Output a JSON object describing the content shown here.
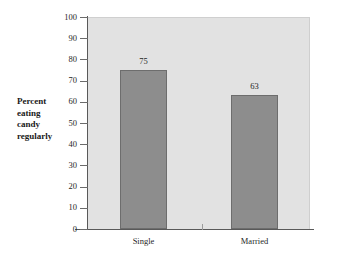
{
  "chart_data": {
    "type": "bar",
    "title": "",
    "subtitle": "",
    "xlabel": "",
    "ylabel": "Percent eating candy regularly",
    "ylabel_lines": [
      "Percent",
      "eating",
      "candy",
      "regularly"
    ],
    "categories": [
      "Single",
      "Married"
    ],
    "values": [
      75,
      63
    ],
    "data_labels": [
      "75",
      "63"
    ],
    "ylim": [
      0,
      100
    ],
    "ytick_step": 10,
    "yticks": [
      0,
      10,
      20,
      30,
      40,
      50,
      60,
      70,
      80,
      90,
      100
    ],
    "ytick_labels": [
      "0",
      "10",
      "20",
      "30",
      "40",
      "50",
      "60",
      "70",
      "80",
      "90",
      "100"
    ],
    "grid": false,
    "legend": null,
    "legend_position": "none",
    "series": [
      {
        "name": "Percent eating candy regularly",
        "values": [
          75,
          63
        ]
      }
    ],
    "colors": {
      "bar_fill": "#8d8d8d",
      "bar_border": "#6d6d6d",
      "plot_background": "#e2e2e2",
      "axis_line": "#595959",
      "page_background": "#ffffff",
      "text": "#1f1f1f",
      "axis_title_text": "#1a1a1a"
    }
  }
}
